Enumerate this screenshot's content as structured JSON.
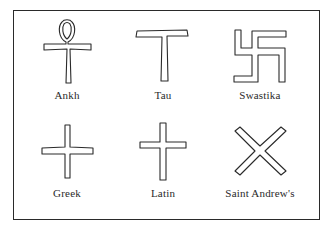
{
  "figure": {
    "symbols": [
      {
        "name": "Ankh",
        "shape": "ankh-icon"
      },
      {
        "name": "Tau",
        "shape": "tau-cross-icon"
      },
      {
        "name": "Swastika",
        "shape": "swastika-icon"
      },
      {
        "name": "Greek",
        "shape": "greek-cross-icon"
      },
      {
        "name": "Latin",
        "shape": "latin-cross-icon"
      },
      {
        "name": "Saint Andrew's",
        "shape": "saint-andrews-cross-icon"
      }
    ]
  }
}
